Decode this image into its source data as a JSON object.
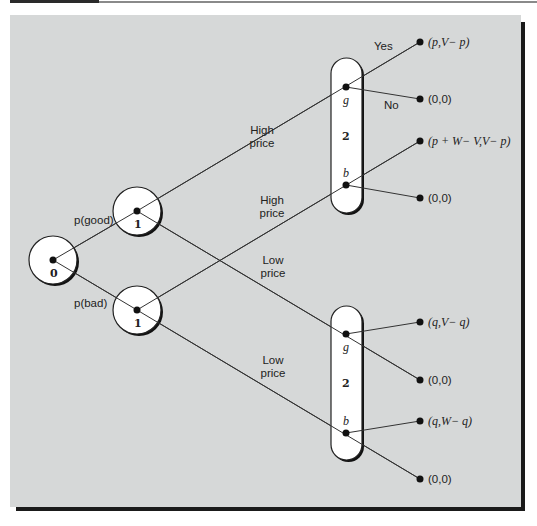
{
  "diagram": {
    "type": "game-tree",
    "nodes": {
      "n0": {
        "label": "0",
        "player": "Nature"
      },
      "n1_good": {
        "label": "1"
      },
      "n1_bad": {
        "label": "1"
      },
      "info_set_high": {
        "label": "2",
        "upper_node": "g",
        "lower_node": "b"
      },
      "info_set_low": {
        "label": "2",
        "upper_node": "g",
        "lower_node": "b"
      }
    },
    "branch_labels": {
      "good": "p(good)",
      "bad": "p(bad)",
      "high_price_1": [
        "High",
        "price"
      ],
      "high_price_2": [
        "High",
        "price"
      ],
      "low_price_1": [
        "Low",
        "price"
      ],
      "low_price_2": [
        "Low",
        "price"
      ],
      "yes": "Yes",
      "no": "No"
    },
    "payoffs": [
      "(p,V− p)",
      "(0,0)",
      "(p + W− V,V− p)",
      "(0,0)",
      "(q,V− q)",
      "(0,0)",
      "(q,W− q)",
      "(0,0)"
    ]
  }
}
